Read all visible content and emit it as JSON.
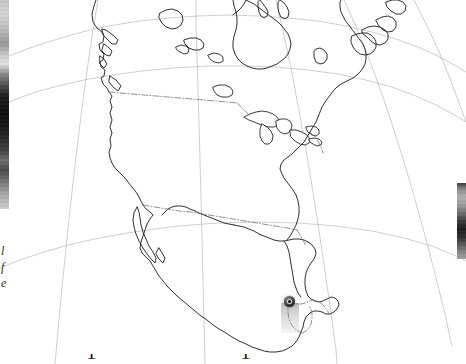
{
  "figure": {
    "kind": "locator-map",
    "region": "North America",
    "projection": "conic",
    "background_color": "#ffffff",
    "outline_color": "#1a1a1a",
    "graticule_color": "#b9b9b9",
    "border_color": "#6e6e6e",
    "width": 466,
    "height": 364
  },
  "marker": {
    "name": "study-site-marker",
    "label": "",
    "fill_color": "#111111",
    "core_color": "#f2f2f2",
    "x": 289,
    "y": 301,
    "approx_location": "Guatemala / Belize border region"
  },
  "caption": {
    "left_fragment": "l\nf\ne",
    "bottom_fragment": "1   1"
  },
  "side_images": {
    "left_thumbnail_alt": "grayscale-photo-strip",
    "right_thumbnail_alt": "grayscale-photo-thumbnail"
  },
  "map_geometry": {
    "note": "Coastline, lake, and political-border polylines in screen pixel coordinates (466x364).",
    "coastlines": [
      "M 96 0 L 94 6 L 92 14 L 93 22 L 97 28 L 101 31 L 104 36 L 103 42 L 99 44 L 100 50 L 104 54 L 103 60 L 100 62 L 101 67 L 105 70 L 104 76 L 101 78 L 103 84 L 107 88 L 109 92 L 112 96 L 110 101 L 112 107 L 110 113 L 112 120 L 110 127 L 112 133 L 110 139 L 111 146 L 109 152 L 110 158 L 112 163 L 115 168 L 119 172 L 124 177 L 128 182 L 132 187 L 136 192 L 139 197 L 141 201 L 143 205",
      "M 102 29 L 106 30 L 110 33 L 114 36 L 118 40 L 116 44 L 112 44 L 108 40 L 104 36 Z",
      "M 104 44 L 108 47 L 112 51 L 110 56 L 106 55 L 102 51 Z",
      "M 100 56 L 104 59 L 107 64 L 104 68 L 100 64 Z",
      "M 110 76 L 116 80 L 121 86 L 118 91 L 113 87 L 109 82 Z",
      "M 143 205 L 146 209 L 150 212 L 153 215 L 150 219 L 147 224 L 145 230 L 143 236 L 141 242 L 140 248 L 142 253 L 146 257 L 150 261 L 153 266 L 156 271 L 159 276 L 163 281 L 167 286 L 172 291 L 177 296 L 183 301 L 189 306 L 195 311 L 201 316 L 207 320 L 213 325 L 219 329 L 226 333 L 232 337 L 239 341 L 246 344 L 252 347 L 258 349 L 264 351 L 270 352 L 276 352 L 282 351 L 287 349 L 292 346 L 296 342 L 299 337 L 301 332 L 303 327 L 304 322 L 306 317",
      "M 137 207 L 134 213 L 133 220 L 134 227 L 136 234 L 139 241 L 143 248 L 147 254 L 151 259 L 155 263 L 156 258 L 153 252 L 149 246 L 146 239 L 143 232 L 141 225 L 140 218 L 139 212 Z",
      "M 159 248 L 162 253 L 165 258 L 163 263 L 159 259 L 156 254 Z",
      "M 306 317 L 310 313 L 314 311 L 318 311 L 322 312 L 326 314 L 330 314 L 334 312 L 337 309 L 339 305 L 338 301 L 335 298 L 331 297 L 327 299 L 323 301 L 319 302 L 315 301 L 311 299 L 308 296",
      "M 308 296 L 306 291 L 305 285 L 305 279 L 306 273 L 308 268 L 311 263 L 314 259 L 316 254 L 315 249 L 312 245 L 308 242",
      "M 308 242 L 304 240 L 299 239 L 294 239 L 289 240 L 284 241 L 279 241 L 274 240 L 269 238 L 264 236 L 259 234 L 254 231 L 249 229 L 244 227 L 239 226 L 234 225",
      "M 234 225 L 229 224 L 224 223 L 219 221 L 214 219 L 209 217 L 204 215 L 199 213 L 195 211 L 190 209 L 186 207 L 181 206 L 176 206 L 172 207 L 168 209 L 165 212 L 162 215",
      "M 284 241 L 287 246 L 289 252 L 290 258 L 291 264 L 292 270 L 293 276 L 294 282 L 296 288 L 298 293 L 301 297",
      "M 296 195 L 298 201 L 299 207 L 299 213 L 298 219 L 296 225 L 293 231 L 290 236 L 287 240",
      "M 296 195 L 293 190 L 290 186 L 287 182 L 284 178 L 282 174 L 280 169 L 281 164 L 284 160 L 288 157 L 292 154 L 296 150 L 300 146 L 304 142 L 307 137 L 310 132 L 313 127 L 316 122 L 318 117 L 320 112 L 322 107 L 325 102 L 328 98 L 331 94 L 334 90 L 337 87",
      "M 337 87 L 341 84 L 345 82 L 349 80 L 353 78 L 357 75 L 360 72 L 363 68 L 365 64 L 366 59 L 366 54 L 365 49 L 363 44 L 360 40 L 357 36 L 354 32 L 351 28 L 348 24 L 345 20 L 343 16 L 341 12 L 340 7 L 340 2 L 341 0",
      "M 352 36 L 357 34 L 362 33 L 367 33 L 371 35 L 374 38 L 376 42 L 376 47 L 374 51 L 370 54 L 365 55 L 360 54 L 356 51 L 353 47 L 351 42 Z",
      "M 362 30 L 368 27 L 374 26 L 380 27 L 385 30 L 388 34 L 388 39 L 385 43 L 380 45 L 375 44 L 371 41 L 367 37 L 363 34 Z",
      "M 376 20 L 382 17 L 388 16 L 393 18 L 396 22 L 396 27 L 393 31 L 388 32 L 383 30 L 379 26 Z",
      "M 386 2 L 392 0 L 398 0 L 403 2 L 406 6 L 405 11 L 401 14 L 396 14 L 391 11 L 387 7 Z",
      "M 316 49 L 320 48 L 324 50 L 327 54 L 327 59 L 324 63 L 320 64 L 316 62 L 314 57 L 314 52 Z",
      "M 233 0 L 234 6 L 236 12 L 237 18 L 237 24 L 236 30 L 234 36 L 233 42 L 233 48 L 235 54 L 238 59 L 242 63 L 247 66 L 252 68 L 257 69 L 262 69 L 267 68 L 272 66 L 277 64 L 281 61 L 285 58 L 288 54 L 290 49 L 291 44 L 290 39 L 288 34 L 285 30 L 282 26 L 278 22 L 274 19 L 270 16 L 266 13 L 262 10 L 258 7 L 254 4 L 250 2 L 246 0",
      "M 246 0 L 244 4 L 241 8 L 238 11 L 235 13 L 233 15",
      "M 260 0 L 263 4 L 266 8 L 268 12 L 267 16 L 264 18 L 261 16 L 259 12 L 258 7 L 258 2 Z",
      "M 280 0 L 284 3 L 287 7 L 289 12 L 288 17 L 285 19 L 281 17 L 279 13 L 278 8 L 278 3 Z",
      "M 160 13 L 166 10 L 172 9 L 178 11 L 182 15 L 183 20 L 181 25 L 177 28 L 172 29 L 166 27 L 162 23 L 159 18 Z",
      "M 184 40 L 190 38 L 196 38 L 201 40 L 204 44 L 203 48 L 199 50 L 194 50 L 189 48 L 185 44 Z"
    ],
    "lakes": [
      "M 244 117 L 250 114 L 256 112 L 262 111 L 268 112 L 273 114 L 277 117 L 279 121 L 278 125 L 274 127 L 269 127 L 264 126 L 259 124 L 254 122 L 249 120 Z",
      "M 262 124 L 267 127 L 271 131 L 273 136 L 272 141 L 269 144 L 265 144 L 262 141 L 260 136 L 260 130 Z",
      "M 276 121 L 281 119 L 286 119 L 290 121 L 292 125 L 291 130 L 288 133 L 284 134 L 280 132 L 277 128 Z",
      "M 290 130 L 296 130 L 302 132 L 307 135 L 310 139 L 309 143 L 305 145 L 300 144 L 295 141 L 291 137 Z",
      "M 306 127 L 311 126 L 316 127 L 319 130 L 319 134 L 316 136 L 312 135 L 308 132 Z",
      "M 309 139 L 314 138 L 319 139 L 322 142 L 321 145 L 317 146 L 313 144 L 310 142 Z",
      "M 213 87 L 219 85 L 225 85 L 230 87 L 233 91 L 232 95 L 228 97 L 222 97 L 217 95 L 214 91 Z",
      "M 208 55 L 214 53 L 219 54 L 223 57 L 223 61 L 219 63 L 214 62 L 210 59 Z",
      "M 176 47 L 181 45 L 186 46 L 189 49 L 188 53 L 184 54 L 180 52 L 177 50 Z"
    ],
    "borders": [
      "M 109 92 L 120 93 L 132 94 L 144 95 L 156 96 L 168 97 L 180 98 L 192 99 L 204 100 L 216 101 L 228 102 L 237 103",
      "M 237 103 L 241 107 L 245 111 L 249 115",
      "M 310 132 L 314 136 L 318 141 L 321 147 L 323 153",
      "M 143 205 L 155 207 L 167 209 L 179 211 L 191 212 L 203 214 L 215 216 L 227 218 L 239 220 L 251 222 L 263 224 L 275 226 L 287 228 L 297 230",
      "M 297 230 L 300 235 L 303 240 L 306 246",
      "M 289 301 L 293 303 L 297 304 L 301 304 L 305 303 L 309 301 L 313 300 L 317 301 L 321 303 L 324 306 L 327 310 L 329 314",
      "M 289 301 L 288 307 L 288 313 L 289 319 L 291 324 L 294 328 L 298 331 L 302 333",
      "M 302 333 L 306 331 L 309 328 L 311 324 L 312 319 L 312 314 L 311 309 L 309 305"
    ],
    "graticule": [
      "M 0 60 L 14 54 L 30 48 L 48 42 L 68 36 L 90 30 L 114 25 L 140 21 L 168 18 L 198 16 L 228 15 L 258 16 L 288 18 L 318 21 L 346 26 L 372 32 L 396 39 L 418 47 L 438 56 L 456 66 L 466 72",
      "M 0 106 L 16 99 L 36 92 L 58 86 L 84 80 L 112 75 L 142 71 L 174 68 L 208 66 L 242 66 L 276 67 L 308 70 L 338 74 L 366 80 L 392 87 L 416 96 L 438 106 L 458 117 L 466 122",
      "M 0 268 L 20 260 L 44 252 L 72 244 L 104 237 L 140 231 L 178 226 L 218 223 L 258 222 L 298 223 L 336 226 L 372 231 L 404 238 L 432 246 L 456 256 L 466 261",
      "M 98 0 L 94 24 L 90 50 L 86 78 L 82 108 L 78 140 L 74 174 L 70 210 L 66 248 L 62 288 L 58 330 L 55 364",
      "M 196 0 L 196 28 L 197 58 L 198 90 L 199 124 L 200 160 L 201 198 L 202 238 L 203 280 L 204 322 L 205 364",
      "M 276 0 L 282 26 L 288 54 L 294 84 L 300 116 L 306 150 L 312 186 L 318 224 L 324 264 L 330 306 L 336 350 L 337 364",
      "M 344 0 L 354 22 L 364 46 L 374 72 L 384 100 L 394 130 L 404 162 L 414 196 L 424 232 L 434 270 L 444 310 L 452 346",
      "M 414 0 L 422 16 L 431 34 L 440 54 L 449 76 L 458 100 L 466 122"
    ]
  }
}
